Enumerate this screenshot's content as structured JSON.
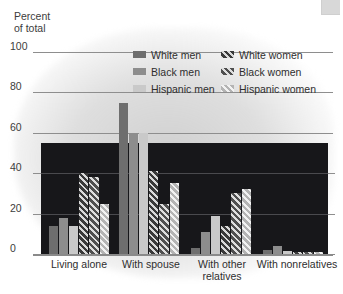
{
  "axis": {
    "y_title": "Percent\nof total",
    "ticks": [
      "100",
      "80",
      "60",
      "40",
      "20",
      "0"
    ]
  },
  "legend": {
    "left": [
      {
        "label": "White men",
        "swatch": "solid-dark-gray"
      },
      {
        "label": "Black men",
        "swatch": "solid-medium-gray"
      },
      {
        "label": "Hispanic men",
        "swatch": "solid-light-gray"
      }
    ],
    "right": [
      {
        "label": "White women",
        "swatch": "hatched-dark"
      },
      {
        "label": "Black women",
        "swatch": "hatched-medium"
      },
      {
        "label": "Hispanic women",
        "swatch": "hatched-light"
      }
    ]
  },
  "xlabels": [
    "Living alone",
    "With spouse",
    "With other\nrelatives",
    "With nonrelatives"
  ],
  "colors": {
    "white_men": "#6e6e6e",
    "black_men": "#8d8d8d",
    "hispanic_men": "#c9c9c9",
    "white_women": "#2a2a2a",
    "black_women": "#3a3a3a",
    "hispanic_women": "#9a9a9a",
    "plot_dark_band": "#17171a",
    "gridline": "#8e8e8e",
    "background": "#ffffff"
  },
  "chart_data": {
    "type": "bar",
    "title": "",
    "subtitle": "",
    "xlabel": "",
    "ylabel": "Percent of total",
    "ylim": [
      0,
      100
    ],
    "yticks": [
      0,
      20,
      40,
      60,
      80,
      100
    ],
    "grid": true,
    "legend_position": "top-right",
    "categories": [
      "Living alone",
      "With spouse",
      "With other relatives",
      "With nonrelatives"
    ],
    "series": [
      {
        "name": "White men",
        "values": [
          14,
          75,
          3,
          2
        ]
      },
      {
        "name": "Black men",
        "values": [
          18,
          60,
          11,
          4
        ]
      },
      {
        "name": "Hispanic men",
        "values": [
          14,
          60,
          19,
          1.5
        ]
      },
      {
        "name": "White women",
        "values": [
          40,
          41,
          14,
          1
        ]
      },
      {
        "name": "Black women",
        "values": [
          38,
          25,
          30,
          1
        ]
      },
      {
        "name": "Hispanic women",
        "values": [
          25,
          35,
          32,
          1
        ]
      }
    ]
  }
}
